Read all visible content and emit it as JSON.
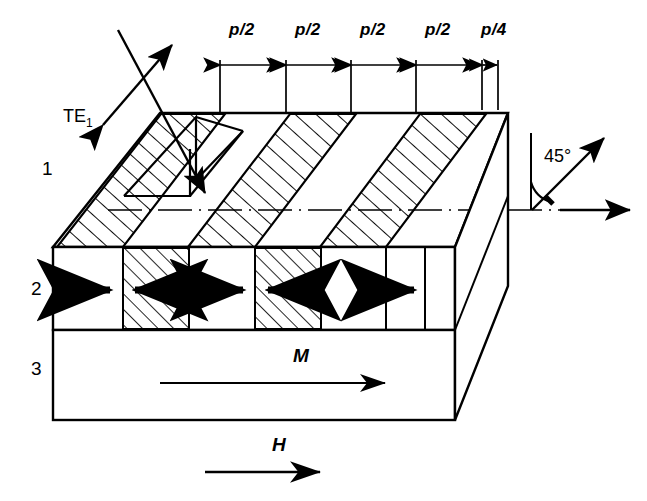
{
  "figure": {
    "kind": "technical-line-diagram"
  },
  "dimensions": {
    "labels": [
      "p/2",
      "p/2",
      "p/2",
      "p/2",
      "p/4"
    ],
    "segments": [
      {
        "label": "p/2",
        "x1": 220,
        "x2": 286
      },
      {
        "label": "p/2",
        "x1": 286,
        "x2": 351
      },
      {
        "label": "p/2",
        "x1": 351,
        "x2": 416
      },
      {
        "label": "p/2",
        "x1": 416,
        "x2": 482
      },
      {
        "label": "p/4",
        "x1": 482,
        "x2": 498
      }
    ],
    "dim_line_y": 65,
    "label_y": 22
  },
  "layers": [
    {
      "id": "1",
      "label": "1",
      "x": 42,
      "y": 158
    },
    {
      "id": "2",
      "label": "2",
      "x": 40,
      "y": 283
    },
    {
      "id": "3",
      "label": "3",
      "x": 40,
      "y": 366
    }
  ],
  "mode": {
    "label": "TE",
    "subscript": "1",
    "label_x": 63,
    "label_y": 108
  },
  "angle": {
    "label": "45°",
    "label_x": 546,
    "label_y": 148
  },
  "vectors": [
    {
      "name": "magnetization",
      "label": "M",
      "x": 300,
      "y": 352
    },
    {
      "name": "applied-field",
      "label": "H",
      "x": 278,
      "y": 442
    }
  ],
  "domains": [
    {
      "index": 0,
      "direction": "right",
      "hatched": false,
      "width": "p/2"
    },
    {
      "index": 1,
      "direction": "left",
      "hatched": true,
      "width": "p/2"
    },
    {
      "index": 2,
      "direction": "right",
      "hatched": false,
      "width": "p/2"
    },
    {
      "index": 3,
      "direction": "left",
      "hatched": true,
      "width": "p/2"
    },
    {
      "index": 4,
      "direction": "right",
      "hatched": false,
      "width": "p/4"
    }
  ],
  "colors": {
    "line": "#000000",
    "background": "#ffffff"
  }
}
